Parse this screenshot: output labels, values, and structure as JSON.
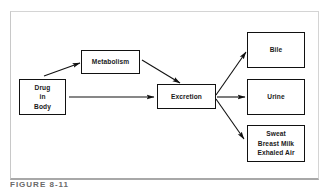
{
  "diagram": {
    "nodes": {
      "drug": {
        "lines": [
          "Drug",
          "in",
          "Body"
        ]
      },
      "metabolism": {
        "label": "Metabolism"
      },
      "excretion": {
        "label": "Excretion"
      },
      "bile": {
        "label": "Bile"
      },
      "urine": {
        "label": "Urine"
      },
      "other": {
        "lines": [
          "Sweat",
          "Breast Milk",
          "Exhaled Air"
        ]
      }
    },
    "edges": [
      {
        "from": "Drug in Body",
        "to": "Metabolism"
      },
      {
        "from": "Drug in Body",
        "to": "Excretion"
      },
      {
        "from": "Metabolism",
        "to": "Excretion"
      },
      {
        "from": "Excretion",
        "to": "Bile"
      },
      {
        "from": "Excretion",
        "to": "Urine"
      },
      {
        "from": "Excretion",
        "to": "Sweat / Breast Milk / Exhaled Air"
      }
    ],
    "colors": {
      "stroke": "#111111",
      "frame": "#c8c8c8",
      "text": "#1a1a1a"
    }
  },
  "caption": "FIGURE 8-11"
}
